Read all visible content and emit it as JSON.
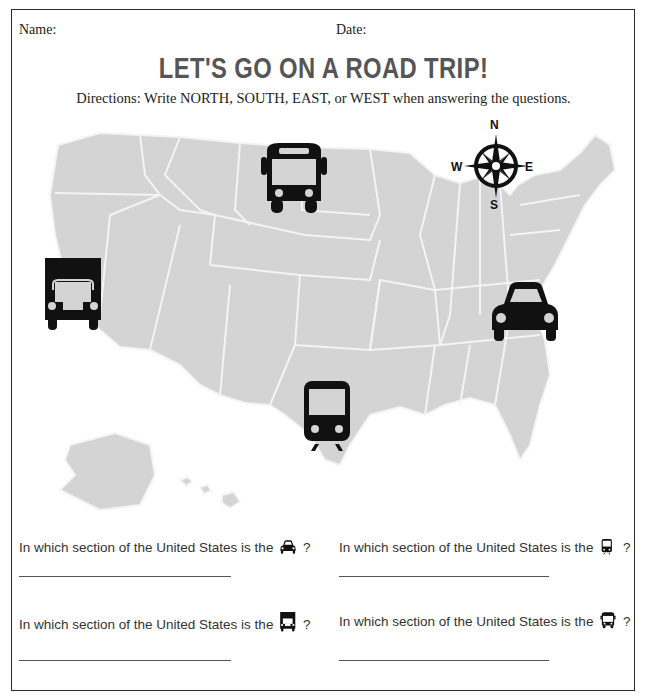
{
  "header": {
    "name_label": "Name:",
    "date_label": "Date:"
  },
  "title": "LET'S GO ON A ROAD TRIP!",
  "directions": "Directions: Write NORTH, SOUTH, EAST, or WEST when answering the questions.",
  "map": {
    "description": "United States map (light gray) with transportation icons",
    "fill_color": "#d4d4d4",
    "border_color": "#f2f2f2",
    "icons": [
      {
        "name": "bus",
        "region": "north",
        "icon": "bus-icon"
      },
      {
        "name": "truck",
        "region": "west",
        "icon": "truck-icon"
      },
      {
        "name": "car",
        "region": "east",
        "icon": "car-icon"
      },
      {
        "name": "train",
        "region": "south",
        "icon": "train-icon"
      }
    ],
    "compass": {
      "n": "N",
      "s": "S",
      "e": "E",
      "w": "W"
    }
  },
  "questions": [
    {
      "prefix": "In which section of the United States is the",
      "icon": "car-icon",
      "suffix": "?"
    },
    {
      "prefix": "In which section of the United States is the",
      "icon": "train-icon",
      "suffix": "?"
    },
    {
      "prefix": "In which section of the United States is the",
      "icon": "truck-icon",
      "suffix": "?"
    },
    {
      "prefix": "In which section of the United States is the",
      "icon": "bus-icon",
      "suffix": "?"
    }
  ]
}
